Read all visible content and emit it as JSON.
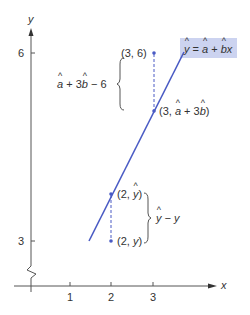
{
  "diagram": {
    "type": "regression-residual-illustration",
    "axes": {
      "x_label": "x",
      "y_label": "y",
      "x_ticks": [
        "1",
        "2",
        "3"
      ],
      "y_ticks": [
        "3",
        "6"
      ],
      "y_axis_break": true
    },
    "regression_line": {
      "equation_parts": {
        "lhs": "y",
        "eq": " = ",
        "a": "a",
        "plus": " + ",
        "b": "b",
        "x": "x"
      },
      "color": "#4a5bc4",
      "label_background": "#ccd3f0"
    },
    "points": [
      {
        "id": "observed-3",
        "label_prefix": "(3, 6)",
        "x": 3,
        "y": 6
      },
      {
        "id": "fitted-3",
        "label_prefix": "(3, ",
        "label_a": "a",
        "label_mid": " + 3",
        "label_b": "b",
        "label_suffix": ")"
      },
      {
        "id": "fitted-2",
        "label_prefix": "(2, ",
        "label_y": "y",
        "label_suffix": ")"
      },
      {
        "id": "observed-2",
        "label_prefix": "(2, ",
        "label_y": "y",
        "label_suffix": ")"
      }
    ],
    "brackets": {
      "upper": {
        "a": "a",
        "mid": " + 3",
        "b": "b",
        "suffix": " − 6"
      },
      "lower": {
        "yhat": "y",
        "suffix": " − y"
      }
    },
    "colors": {
      "axis": "#555555",
      "line": "#4a5bc4",
      "points": "#4a5bc4",
      "text": "#333333"
    }
  }
}
